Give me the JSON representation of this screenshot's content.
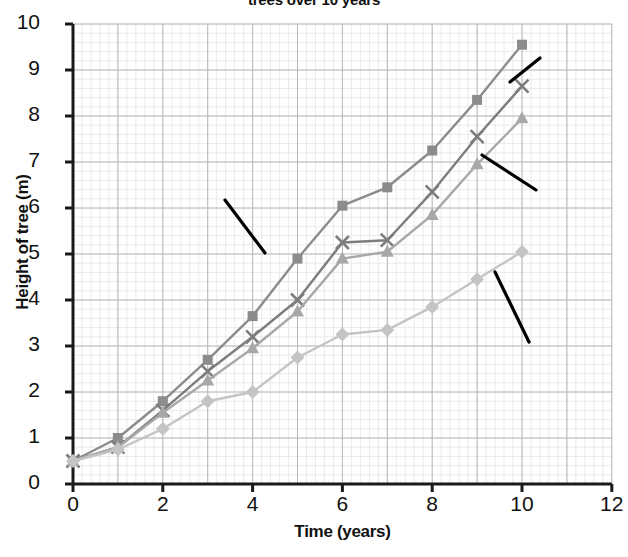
{
  "chart_data": {
    "type": "line",
    "title": "trees over 10 years",
    "xlabel": "Time (years)",
    "ylabel": "Height of tree (m)",
    "xlim": [
      0,
      12
    ],
    "ylim": [
      0,
      10
    ],
    "xticks": [
      "0",
      "2",
      "4",
      "6",
      "8",
      "10",
      "12"
    ],
    "yticks": [
      "0",
      "1",
      "2",
      "3",
      "4",
      "5",
      "6",
      "7",
      "8",
      "9",
      "10"
    ],
    "grid": true,
    "legend_position": "inline-annotations",
    "x": [
      0,
      1,
      2,
      3,
      4,
      5,
      6,
      7,
      8,
      9,
      10
    ],
    "series": [
      {
        "name": "Tree B",
        "marker": "square",
        "color": "#8c8c8c",
        "values": [
          0.5,
          1.0,
          1.8,
          2.7,
          3.65,
          4.9,
          6.05,
          6.45,
          7.25,
          8.35,
          9.55
        ]
      },
      {
        "name": "Tree D",
        "marker": "cross",
        "color": "#7d7d7d",
        "values": [
          0.5,
          0.8,
          1.6,
          2.45,
          3.2,
          4.0,
          5.25,
          5.3,
          6.35,
          7.55,
          8.65
        ]
      },
      {
        "name": "Tree C",
        "marker": "triangle",
        "color": "#a8a8a8",
        "values": [
          0.5,
          0.8,
          1.55,
          2.25,
          2.95,
          3.75,
          4.9,
          5.05,
          5.85,
          6.95,
          7.95
        ]
      },
      {
        "name": "Tree A",
        "marker": "diamond",
        "color": "#c4c4c4",
        "values": [
          0.5,
          0.75,
          1.2,
          1.8,
          2.0,
          2.75,
          3.25,
          3.35,
          3.85,
          4.45,
          5.05
        ]
      }
    ],
    "annotations": [
      {
        "text": "Tree B",
        "target_series": "Tree B"
      },
      {
        "text": "Tree D",
        "target_series": "Tree D"
      },
      {
        "text": "Tree C",
        "target_series": "Tree C"
      },
      {
        "text": "Tree A",
        "target_series": "Tree A"
      }
    ]
  },
  "annotation_labels": {
    "tree_a": "Tree A",
    "tree_b": "Tree B",
    "tree_c": "Tree C",
    "tree_d": "Tree D"
  },
  "axis": {
    "ytick_0": "0",
    "ytick_1": "1",
    "ytick_2": "2",
    "ytick_3": "3",
    "ytick_4": "4",
    "ytick_5": "5",
    "ytick_6": "6",
    "ytick_7": "7",
    "ytick_8": "8",
    "ytick_9": "9",
    "ytick_10": "10",
    "xtick_0": "0",
    "xtick_2": "2",
    "xtick_4": "4",
    "xtick_6": "6",
    "xtick_8": "8",
    "xtick_10": "10",
    "xtick_12": "12"
  },
  "colors": {
    "axis": "#1a1a1a",
    "grid_major": "#b8b8b8",
    "grid_minor": "#e2e2e2",
    "text": "#111111",
    "leader_line": "#000000"
  }
}
